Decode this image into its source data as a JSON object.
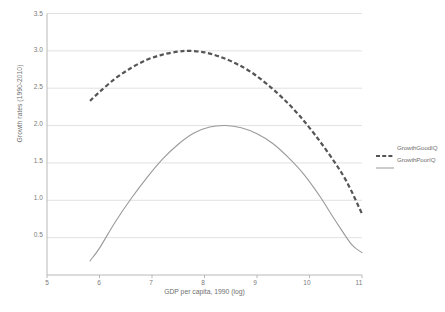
{
  "chart_data": {
    "type": "line",
    "title": "",
    "xlabel": "GDP per capita, 1990 (log)",
    "ylabel": "Growth rates (1990-2010)",
    "xlim": [
      5,
      11
    ],
    "ylim": [
      0,
      3.5
    ],
    "xticks": [
      "5",
      "6",
      "7",
      "8",
      "9",
      "10",
      "11"
    ],
    "yticks": [
      "0.5",
      "1.0",
      "1.5",
      "2.0",
      "2.5",
      "3.0",
      "3.5"
    ],
    "grid": "horizontal",
    "legend_position": "right",
    "series": [
      {
        "name": "GrowthGoodIQ",
        "style": "dashed",
        "color": "#555555",
        "x": [
          5.82,
          6.0,
          6.3,
          6.6,
          6.9,
          7.2,
          7.5,
          7.7,
          8.0,
          8.3,
          8.6,
          8.9,
          9.2,
          9.5,
          9.8,
          10.1,
          10.4,
          10.7,
          11.0
        ],
        "y": [
          2.33,
          2.45,
          2.63,
          2.77,
          2.88,
          2.95,
          2.99,
          3.0,
          2.98,
          2.92,
          2.83,
          2.71,
          2.55,
          2.36,
          2.14,
          1.88,
          1.59,
          1.26,
          0.82
        ]
      },
      {
        "name": "GrowthPoorIQ",
        "style": "solid",
        "color": "#9a9a9a",
        "x": [
          5.82,
          6.0,
          6.3,
          6.6,
          6.9,
          7.2,
          7.5,
          7.8,
          8.1,
          8.4,
          8.7,
          9.0,
          9.3,
          9.6,
          9.9,
          10.2,
          10.5,
          10.8,
          11.0
        ],
        "y": [
          0.19,
          0.36,
          0.71,
          1.02,
          1.3,
          1.55,
          1.75,
          1.9,
          1.98,
          2.0,
          1.97,
          1.89,
          1.76,
          1.57,
          1.34,
          1.05,
          0.72,
          0.41,
          0.3
        ]
      }
    ]
  },
  "axis": {
    "y_title": "Growth rates (1990-2010)",
    "x_title": "GDP per capita, 1990 (log)",
    "yticks": [
      "3.5",
      "3.0",
      "2.5",
      "2.0",
      "1.5",
      "1.0",
      "0.5"
    ],
    "xticks": [
      "5",
      "6",
      "7",
      "8",
      "9",
      "10",
      "11"
    ]
  },
  "legend": {
    "items": [
      {
        "label": "GrowthGoodIQ",
        "color": "#555555",
        "style": "dashed"
      },
      {
        "label": "GrowthPoorIQ",
        "color": "#9a9a9a",
        "style": "solid"
      }
    ]
  },
  "colors": {
    "grid": "#d9d9d9",
    "axis": "#b0b0b0",
    "good_iq": "#555555",
    "poor_iq": "#9a9a9a",
    "text": "#6f6f6f",
    "background": "#ffffff"
  }
}
